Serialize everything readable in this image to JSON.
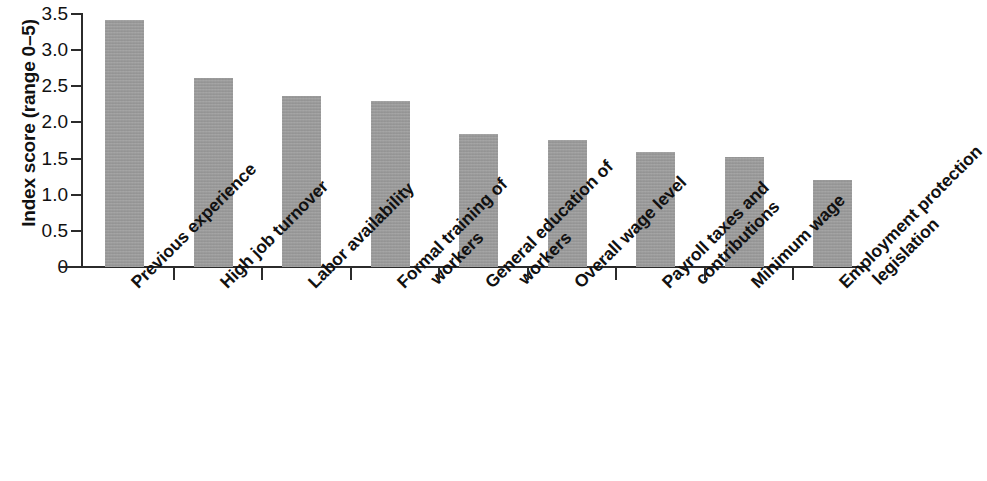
{
  "chart_data": {
    "type": "bar",
    "title": "",
    "xlabel": "",
    "ylabel": "Index score (range 0–5)",
    "ylim": [
      0,
      3.5
    ],
    "grid": false,
    "legend": "none",
    "bar_color": "#9b9b9b",
    "axis_color": "#2b2b2b",
    "y_ticks": [
      "0",
      "0.5",
      "1.0",
      "1.5",
      "2.0",
      "2.5",
      "3.0",
      "3.5"
    ],
    "y_tick_values": [
      0,
      0.5,
      1.0,
      1.5,
      2.0,
      2.5,
      3.0,
      3.5
    ],
    "categories": [
      "Previous experience",
      "High job turnover",
      "Labor availability",
      "Formal training of workers",
      "General education of workers",
      "Overall wage level",
      "Payroll taxes and contributions",
      "Minimum wage",
      "Employment protection legislation"
    ],
    "category_lines": [
      [
        "Previous experience"
      ],
      [
        "High job turnover"
      ],
      [
        "Labor availability"
      ],
      [
        "Formal training of",
        "workers"
      ],
      [
        "General education of",
        "workers"
      ],
      [
        "Overall wage level"
      ],
      [
        "Payroll taxes and",
        "contributions"
      ],
      [
        "Minimum wage"
      ],
      [
        "Employment protection",
        "legislation"
      ]
    ],
    "values": [
      3.42,
      2.62,
      2.37,
      2.29,
      1.84,
      1.76,
      1.59,
      1.52,
      1.21
    ]
  }
}
